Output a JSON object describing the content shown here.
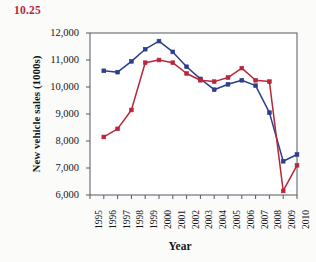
{
  "figure": {
    "exercise_number": "10.25",
    "background_color": "#fbfbfa"
  },
  "chart_data": {
    "type": "line",
    "title": "",
    "xlabel": "Year",
    "ylabel": "New vehicle sales (1000s)",
    "x": [
      1995,
      1996,
      1997,
      1998,
      1999,
      2000,
      2001,
      2002,
      2003,
      2004,
      2005,
      2006,
      2007,
      2008,
      2009,
      2010
    ],
    "xlim": [
      1995,
      2010
    ],
    "ylim": [
      6000,
      12000
    ],
    "yticks": [
      6000,
      7000,
      8000,
      9000,
      10000,
      11000,
      12000
    ],
    "ytick_labels": [
      "6,000",
      "7,000",
      "8,000",
      "9,000",
      "10,000",
      "11,000",
      "12,000"
    ],
    "xtick_labels": [
      "1995",
      "1996",
      "1997",
      "1998",
      "1999",
      "2000",
      "2001",
      "2002",
      "2003",
      "2004",
      "2005",
      "2006",
      "2007",
      "2008",
      "2009",
      "2010"
    ],
    "grid": false,
    "legend_position": "none",
    "series": [
      {
        "name": "Series A",
        "color": "#2b3f8c",
        "marker": "square",
        "x": [
          1996,
          1997,
          1998,
          1999,
          2000,
          2001,
          2002,
          2003,
          2004,
          2005,
          2006,
          2007,
          2008,
          2009,
          2010
        ],
        "values": [
          10600,
          10550,
          10950,
          11400,
          11700,
          11300,
          10750,
          10300,
          9900,
          10100,
          10250,
          10050,
          9050,
          7250,
          7500
        ]
      },
      {
        "name": "Series B",
        "color": "#b9263a",
        "marker": "square",
        "x": [
          1996,
          1997,
          1998,
          1999,
          2000,
          2001,
          2002,
          2003,
          2004,
          2005,
          2006,
          2007,
          2008,
          2009,
          2010
        ],
        "values": [
          8150,
          8450,
          9150,
          10900,
          11000,
          10900,
          10500,
          10250,
          10200,
          10350,
          10700,
          10250,
          10200,
          6150,
          7100
        ]
      }
    ]
  }
}
